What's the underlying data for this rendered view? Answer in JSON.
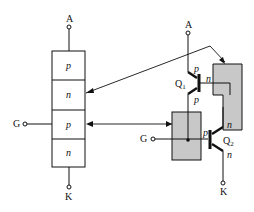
{
  "diagram": {
    "left_structure": {
      "terminals": {
        "anode": "A",
        "gate": "G",
        "cathode": "K"
      },
      "layers": [
        "p",
        "n",
        "p",
        "n"
      ]
    },
    "right_model": {
      "terminals": {
        "anode": "A",
        "gate": "G",
        "cathode": "K"
      },
      "q1": {
        "name": "Q",
        "sub": "1",
        "emitter": "p",
        "base": "n",
        "collector": "p"
      },
      "q2": {
        "name": "Q",
        "sub": "2",
        "base": "p",
        "collector": "n",
        "emitter": "n"
      }
    },
    "colors": {
      "line": "#111111",
      "shade": "#c8c8c8"
    }
  }
}
